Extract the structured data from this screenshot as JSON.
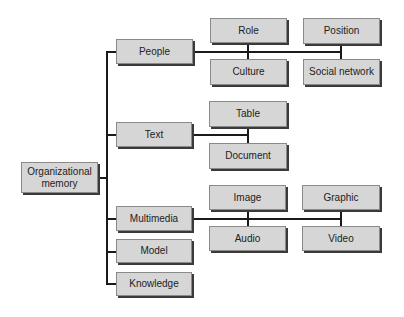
{
  "diagram": {
    "root": {
      "label": "Organizational memory"
    },
    "branches": [
      {
        "label": "People",
        "children": [
          "Role",
          "Culture",
          "Position",
          "Social network"
        ]
      },
      {
        "label": "Text",
        "children": [
          "Table",
          "Document"
        ]
      },
      {
        "label": "Multimedia",
        "children": [
          "Image",
          "Audio",
          "Graphic",
          "Video"
        ]
      },
      {
        "label": "Model",
        "children": []
      },
      {
        "label": "Knowledge",
        "children": []
      }
    ]
  },
  "labels": {
    "root_line1": "Organizational",
    "root_line2": "memory",
    "people": "People",
    "text": "Text",
    "multimedia": "Multimedia",
    "model": "Model",
    "knowledge": "Knowledge",
    "role": "Role",
    "culture": "Culture",
    "position": "Position",
    "social_network": "Social network",
    "table": "Table",
    "document": "Document",
    "image": "Image",
    "audio": "Audio",
    "graphic": "Graphic",
    "video": "Video"
  }
}
